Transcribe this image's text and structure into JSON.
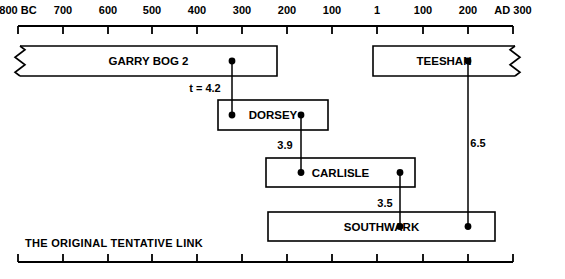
{
  "figure": {
    "caption": "THE ORIGINAL TENTATIVE LINK"
  },
  "axis": {
    "orientation": "horizontal",
    "ticks": [
      {
        "label": "800 BC",
        "x": 18
      },
      {
        "label": "700",
        "x": 63
      },
      {
        "label": "600",
        "x": 108
      },
      {
        "label": "500",
        "x": 152
      },
      {
        "label": "400",
        "x": 197
      },
      {
        "label": "300",
        "x": 242
      },
      {
        "label": "200",
        "x": 287
      },
      {
        "label": "100",
        "x": 332
      },
      {
        "label": "1",
        "x": 377
      },
      {
        "label": "100",
        "x": 423
      },
      {
        "label": "200",
        "x": 468
      },
      {
        "label": "AD 300",
        "x": 513
      }
    ]
  },
  "bars": [
    {
      "name": "garry-bog-2",
      "label": "GARRY BOG 2",
      "x": 20,
      "width": 257,
      "y": 46,
      "height": 30,
      "break_left": true,
      "break_right": false,
      "dots": [
        232
      ]
    },
    {
      "name": "teeshan",
      "label": "TEESHAN",
      "x": 373,
      "width": 142,
      "y": 46,
      "height": 30,
      "break_left": false,
      "break_right": true,
      "dots": [
        468
      ]
    },
    {
      "name": "dorsey",
      "label": "DORSEY",
      "x": 218,
      "width": 110,
      "y": 100,
      "height": 30,
      "break_left": false,
      "break_right": false,
      "dots": [
        232,
        301
      ]
    },
    {
      "name": "carlisle",
      "label": "CARLISLE",
      "x": 266,
      "width": 149,
      "y": 158,
      "height": 29,
      "break_left": false,
      "break_right": false,
      "dots": [
        301,
        400
      ]
    },
    {
      "name": "southwark",
      "label": "SOUTHWARK",
      "x": 268,
      "width": 227,
      "y": 212,
      "height": 29,
      "break_left": false,
      "break_right": false,
      "dots": [
        400,
        468
      ]
    }
  ],
  "links": [
    {
      "name": "garrybog2-dorsey",
      "value": "t = 4.2",
      "x": 232,
      "y1": 61,
      "y2": 115,
      "label_x": 205,
      "label_y": 92
    },
    {
      "name": "dorsey-carlisle",
      "value": "3.9",
      "x": 301,
      "y1": 115,
      "y2": 173,
      "label_x": 285,
      "label_y": 149
    },
    {
      "name": "carlisle-southwark",
      "value": "3.5",
      "x": 400,
      "y1": 173,
      "y2": 227,
      "label_x": 385,
      "label_y": 207
    },
    {
      "name": "teeshan-southwark",
      "value": "6.5",
      "x": 468,
      "y1": 61,
      "y2": 227,
      "label_x": 478,
      "label_y": 147
    }
  ],
  "chart_data": {
    "type": "table",
    "title": "THE ORIGINAL TENTATIVE LINK",
    "xlabel": "Calendar years (BC / AD)",
    "ylabel": "",
    "xlim": [
      -800,
      300
    ],
    "grid": false,
    "legend": "none",
    "x_tick_labels": [
      "800 BC",
      "700",
      "600",
      "500",
      "400",
      "300",
      "200",
      "100",
      "1",
      "100",
      "200",
      "AD 300"
    ],
    "x_tick_values": [
      -800,
      -700,
      -600,
      -500,
      -400,
      -300,
      -200,
      -100,
      1,
      100,
      200,
      300
    ],
    "samples": [
      {
        "name": "GARRY BOG 2",
        "start_label": "< 800 BC",
        "end_label": "~230 BC",
        "truncated_left": true,
        "match_points": [
          "~330 BC"
        ]
      },
      {
        "name": "TEESHAN",
        "start_label": "~AD 80",
        "end_label": "> AD 300",
        "truncated_right": true,
        "match_points": [
          "~AD 210"
        ]
      },
      {
        "name": "DORSEY",
        "start_label": "~360 BC",
        "end_label": "~115 BC",
        "match_points": [
          "~330 BC",
          "~180 BC"
        ]
      },
      {
        "name": "CARLISLE",
        "start_label": "~255 BC",
        "end_label": "~AD 75",
        "match_points": [
          "~180 BC",
          "~AD 50"
        ]
      },
      {
        "name": "SOUTHWARK",
        "start_label": "~250 BC",
        "end_label": "~AD 255",
        "match_points": [
          "~AD 50",
          "~AD 210"
        ]
      }
    ],
    "link_values": [
      {
        "from": "GARRY BOG 2",
        "to": "DORSEY",
        "t": 4.2,
        "label": "t = 4.2"
      },
      {
        "from": "DORSEY",
        "to": "CARLISLE",
        "t": 3.9,
        "label": "3.9"
      },
      {
        "from": "CARLISLE",
        "to": "SOUTHWARK",
        "t": 3.5,
        "label": "3.5"
      },
      {
        "from": "TEESHAN",
        "to": "SOUTHWARK",
        "t": 6.5,
        "label": "6.5"
      }
    ]
  }
}
